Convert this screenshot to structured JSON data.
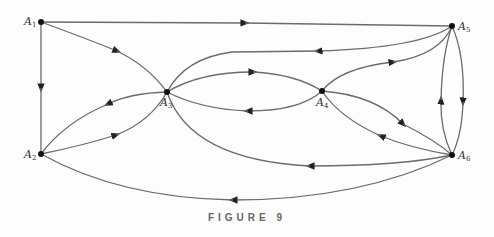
{
  "figure": {
    "caption": "FIGURE 9",
    "edge_color": "#6b6b6b",
    "node_color": "#111111"
  },
  "nodes": [
    {
      "id": "A1",
      "letter": "A",
      "sub": "1",
      "x": 41,
      "y": 22
    },
    {
      "id": "A2",
      "letter": "A",
      "sub": "2",
      "x": 41,
      "y": 154
    },
    {
      "id": "A3",
      "letter": "A",
      "sub": "3",
      "x": 167,
      "y": 92
    },
    {
      "id": "A4",
      "letter": "A",
      "sub": "4",
      "x": 322,
      "y": 91
    },
    {
      "id": "A5",
      "letter": "A",
      "sub": "5",
      "x": 452,
      "y": 26
    },
    {
      "id": "A6",
      "letter": "A",
      "sub": "6",
      "x": 452,
      "y": 155
    }
  ],
  "edges": [
    {
      "from": "A1",
      "to": "A5"
    },
    {
      "from": "A1",
      "to": "A2"
    },
    {
      "from": "A1",
      "to": "A3"
    },
    {
      "from": "A3",
      "to": "A2"
    },
    {
      "from": "A2",
      "to": "A3"
    },
    {
      "from": "A5",
      "to": "A3"
    },
    {
      "from": "A3",
      "to": "A4"
    },
    {
      "from": "A4",
      "to": "A3"
    },
    {
      "from": "A4",
      "to": "A5"
    },
    {
      "from": "A5",
      "to": "A6"
    },
    {
      "from": "A6",
      "to": "A5"
    },
    {
      "from": "A4",
      "to": "A6"
    },
    {
      "from": "A6",
      "to": "A4"
    },
    {
      "from": "A6",
      "to": "A3"
    },
    {
      "from": "A6",
      "to": "A2"
    }
  ]
}
